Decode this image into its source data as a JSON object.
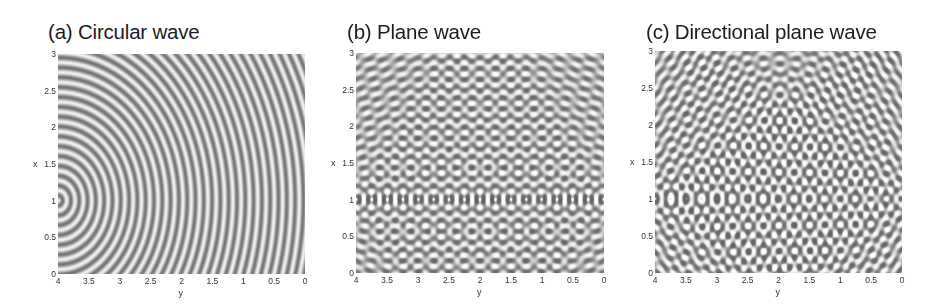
{
  "figure": {
    "panels": [
      {
        "id": "a",
        "title": "(a) Circular wave",
        "x_axis_label": "y",
        "y_axis_label": "x"
      },
      {
        "id": "b",
        "title": "(b) Plane wave",
        "x_axis_label": "y",
        "y_axis_label": "x"
      },
      {
        "id": "c",
        "title": "(c) Directional plane wave",
        "x_axis_label": "y",
        "y_axis_label": "x"
      }
    ],
    "x_ticks": [
      "4",
      "3.5",
      "3",
      "2.5",
      "2",
      "1.5",
      "1",
      "0.5",
      "0"
    ],
    "y_ticks": [
      "3",
      "2.5",
      "2",
      "1.5",
      "1",
      "0.5",
      "0"
    ],
    "colormap": "grayscale"
  },
  "chart_data": [
    {
      "type": "heatmap",
      "title": "(a) Circular wave",
      "xlabel": "y",
      "ylabel": "x",
      "xlim": [
        4,
        0
      ],
      "ylim": [
        0,
        3
      ],
      "x_ticks": [
        4,
        3.5,
        3,
        2.5,
        2,
        1.5,
        1,
        0.5,
        0
      ],
      "y_ticks": [
        0,
        0.5,
        1,
        1.5,
        2,
        2.5,
        3
      ],
      "description": "Concentric circular wavefronts emanating from a point source at (y=4, x=1)",
      "source": {
        "y": 4,
        "x": 1
      },
      "grid": false,
      "colormap": "gray"
    },
    {
      "type": "heatmap",
      "title": "(b) Plane wave",
      "xlabel": "y",
      "ylabel": "x",
      "xlim": [
        4,
        0
      ],
      "ylim": [
        0,
        3
      ],
      "x_ticks": [
        4,
        3.5,
        3,
        2.5,
        2,
        1.5,
        1,
        0.5,
        0
      ],
      "y_ticks": [
        0,
        0.5,
        1,
        1.5,
        2,
        2.5,
        3
      ],
      "description": "Plane wave generated by a line array of sources along x=1; interference pattern with dark nodes along x=1 and horizontal wavefronts far from the array",
      "source_line": {
        "x": 1,
        "y_range": [
          0,
          4
        ]
      },
      "grid": false,
      "colormap": "gray"
    },
    {
      "type": "heatmap",
      "title": "(c) Directional plane wave",
      "xlabel": "y",
      "ylabel": "x",
      "xlim": [
        4,
        0
      ],
      "ylim": [
        0,
        3
      ],
      "x_ticks": [
        4,
        3.5,
        3,
        2.5,
        2,
        1.5,
        1,
        0.5,
        0
      ],
      "y_ticks": [
        0,
        0.5,
        1,
        1.5,
        2,
        2.5,
        3
      ],
      "description": "Steered (directional) plane wave from a phased line array along x=1, producing tilted wavefronts and a Mach-cone-like front",
      "source_line": {
        "x": 1,
        "y_range": [
          0,
          4
        ]
      },
      "grid": false,
      "colormap": "gray"
    }
  ]
}
